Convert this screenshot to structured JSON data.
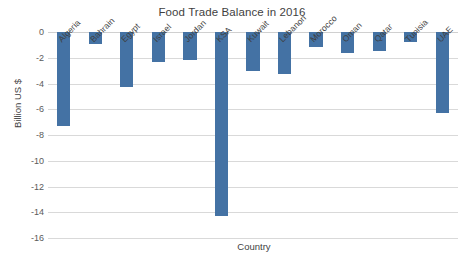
{
  "chart_data": {
    "type": "bar",
    "title": "Food Trade Balance in 2016",
    "xlabel": "Country",
    "ylabel": "Billion US $",
    "categories": [
      "Algeria",
      "Bahrain",
      "Egypt",
      "Israel",
      "Jordan",
      "KSA",
      "Kuwait",
      "Lebanon",
      "Morocco",
      "Oman",
      "Qatar",
      "Tunisia",
      "UAE"
    ],
    "values": [
      -7.3,
      -0.9,
      -4.3,
      -2.3,
      -2.2,
      -14.3,
      -3.0,
      -3.3,
      -1.2,
      -1.6,
      -1.5,
      -0.8,
      -6.3
    ],
    "ylim": [
      -16,
      0
    ],
    "ytick_labels": [
      "0",
      "-2",
      "-4",
      "-6",
      "-8",
      "-10",
      "-12",
      "-14",
      "-16"
    ],
    "ytick_values": [
      0,
      -2,
      -4,
      -6,
      -8,
      -10,
      -12,
      -14,
      -16
    ],
    "grid": true,
    "legend": false,
    "bar_color": "#4472a4",
    "gridline_color": "#d9d9d9",
    "background_color": "#ffffff",
    "text_color": "#3f3f3f"
  }
}
